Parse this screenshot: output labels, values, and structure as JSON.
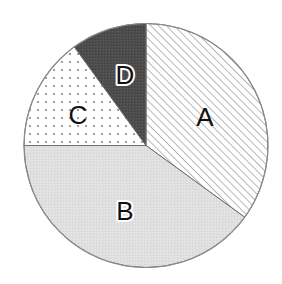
{
  "chart_data": {
    "type": "pie",
    "title": "",
    "start_angle_deg": 0,
    "direction": "clockwise",
    "categories": [
      "A",
      "B",
      "C",
      "D"
    ],
    "values": [
      35,
      40,
      15,
      10
    ],
    "unit": "%",
    "legend": "none",
    "labels_inside": true
  },
  "geometry": {
    "cx": 146,
    "cy": 145.5,
    "r": 122
  },
  "slices": [
    {
      "label": "A",
      "value": 35,
      "fill_style": "diagonal-hatch",
      "base_color": "#ffffff",
      "pattern_color": "#9a9a9a",
      "label_x": 205,
      "label_y": 117,
      "outlined_label": false
    },
    {
      "label": "B",
      "value": 40,
      "fill_style": "light-gray",
      "base_color": "#e0e0e0",
      "pattern_color": "#d2d2d2",
      "label_x": 125,
      "label_y": 211,
      "outlined_label": true
    },
    {
      "label": "C",
      "value": 15,
      "fill_style": "dots",
      "base_color": "#ffffff",
      "pattern_color": "#8a8a8a",
      "label_x": 78,
      "label_y": 115,
      "outlined_label": false
    },
    {
      "label": "D",
      "value": 10,
      "fill_style": "dark-gray",
      "base_color": "#4d4d4d",
      "pattern_color": "#3f3f3f",
      "label_x": 125,
      "label_y": 75,
      "outlined_label": true
    }
  ],
  "colors": {
    "outline": "#8c8c8c",
    "divider": "#6e6e6e",
    "label": "#111111"
  }
}
